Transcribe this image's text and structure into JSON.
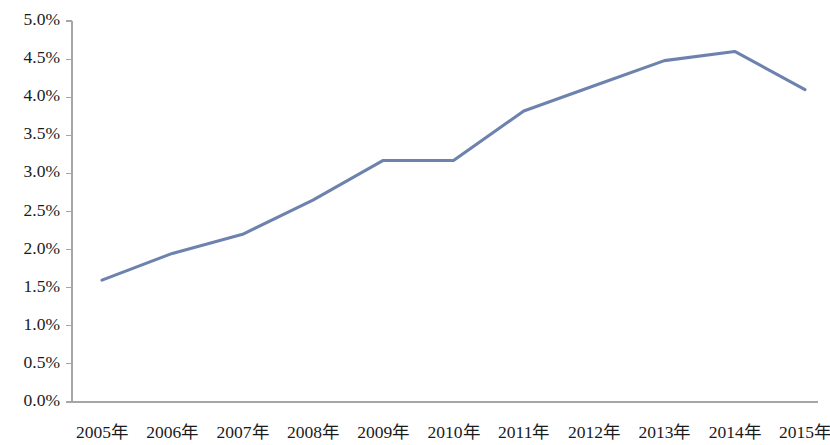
{
  "chart_data": {
    "type": "line",
    "title": "",
    "subtitle": "",
    "xlabel": "",
    "ylabel": "",
    "categories": [
      "2005年",
      "2006年",
      "2007年",
      "2008年",
      "2009年",
      "2010年",
      "2011年",
      "2012年",
      "2013年",
      "2014年",
      "2015年"
    ],
    "series": [
      {
        "name": "",
        "color": "#6E82AE",
        "values": [
          1.6,
          1.95,
          2.2,
          2.65,
          3.17,
          3.17,
          3.82,
          4.15,
          4.48,
          4.6,
          4.1
        ]
      }
    ],
    "ylim": [
      0.0,
      5.0
    ],
    "ytick_values": [
      0.0,
      0.5,
      1.0,
      1.5,
      2.0,
      2.5,
      3.0,
      3.5,
      4.0,
      4.5,
      5.0
    ],
    "ytick_labels": [
      "0.0%",
      "0.5%",
      "1.0%",
      "1.5%",
      "2.0%",
      "2.5%",
      "3.0%",
      "3.5%",
      "4.0%",
      "4.5%",
      "5.0%"
    ],
    "value_suffix": "%",
    "grid": false,
    "legend": false,
    "legend_position": "none",
    "markers": false,
    "axis_color": "#A6A6A6",
    "background_color": "#FFFFFF",
    "annotations": []
  },
  "plot_geometry": {
    "left": 72,
    "right": 818,
    "top": 21,
    "bottom": 402,
    "first_point_x": 102,
    "last_point_x": 805,
    "xlabel_baseline_y": 438
  }
}
